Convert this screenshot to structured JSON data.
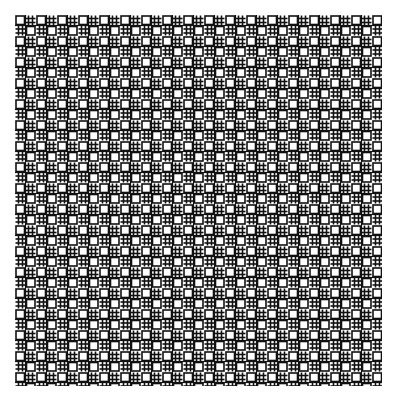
{
  "image": {
    "description": "Dense black-on-white lattice pattern of small squares and hash (#) motifs forming a woven grid",
    "background_color": "#ffffff",
    "line_color": "#111111",
    "pattern_bounds": {
      "x": 15,
      "y": 15,
      "width": 367,
      "height": 371
    },
    "cell_period_px": 10.5,
    "motifs": [
      "square-cell",
      "hash-cross"
    ]
  }
}
